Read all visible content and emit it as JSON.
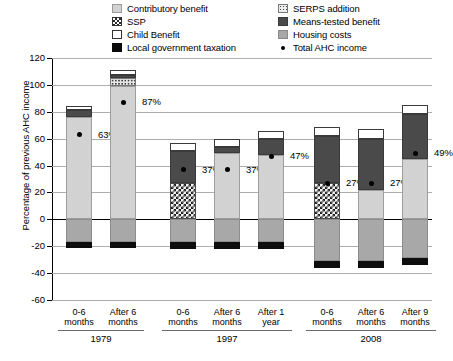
{
  "legend": {
    "left": [
      {
        "label": "Contributory benefit",
        "swatch": "contributory-swatch"
      },
      {
        "label": "SSP",
        "swatch": "ssp-swatch"
      },
      {
        "label": "Child Benefit",
        "swatch": "child-benefit-swatch"
      },
      {
        "label": "Local government taxation",
        "swatch": "local-government-taxation-swatch"
      }
    ],
    "right": [
      {
        "label": "SERPS addition",
        "swatch": "serps-swatch"
      },
      {
        "label": "Means-tested benefit",
        "swatch": "means-tested-swatch"
      },
      {
        "label": "Housing costs",
        "swatch": "housing-costs-swatch"
      },
      {
        "label": "Total AHC income",
        "swatch": "total-ahc-income-marker"
      }
    ]
  },
  "chart_data": {
    "type": "bar",
    "title": "",
    "xlabel": "",
    "ylabel": "Percentage of previous AHC income",
    "ylim": [
      -60,
      120
    ],
    "yticks": [
      120,
      100,
      80,
      60,
      40,
      20,
      0,
      -20,
      -40,
      -60
    ],
    "grid": true,
    "legend_position": "top",
    "stacked": true,
    "groups": [
      {
        "year": "1979",
        "categories": [
          "0-6 months",
          "After 6 months"
        ]
      },
      {
        "year": "1997",
        "categories": [
          "0-6 months",
          "After 6 months",
          "After 1 year"
        ]
      },
      {
        "year": "2008",
        "categories": [
          "0-6 months",
          "After 6 months",
          "After 9 months"
        ]
      }
    ],
    "categories": [
      "0-6 months",
      "After 6 months",
      "0-6 months",
      "After 6 months",
      "After 1 year",
      "0-6 months",
      "After 6 months",
      "After 9 months"
    ],
    "series": [
      {
        "name": "Contributory benefit",
        "values": [
          76,
          99,
          0,
          49,
          48,
          0,
          22,
          45
        ]
      },
      {
        "name": "SSP",
        "values": [
          0,
          0,
          27,
          0,
          0,
          27,
          0,
          0
        ]
      },
      {
        "name": "SERPS addition",
        "values": [
          0,
          6,
          0,
          0,
          0,
          0,
          0,
          0
        ]
      },
      {
        "name": "Means-tested benefit",
        "values": [
          5,
          2,
          24,
          5,
          12,
          35,
          38,
          33
        ]
      },
      {
        "name": "Child Benefit",
        "values": [
          3,
          4,
          6,
          6,
          6,
          7,
          7,
          7
        ]
      },
      {
        "name": "Housing costs",
        "values": [
          -17,
          -17,
          -17,
          -17,
          -17,
          -31,
          -31,
          -29
        ]
      },
      {
        "name": "Local government taxation",
        "values": [
          -4,
          -4,
          -5,
          -5,
          -5,
          -5,
          -5,
          -5
        ]
      }
    ],
    "total_ahc_income": {
      "name": "Total AHC income",
      "values": [
        63,
        87,
        37,
        37,
        47,
        27,
        27,
        49
      ],
      "labels": [
        "63%",
        "87%",
        "37%",
        "37%",
        "47%",
        "27%",
        "27%",
        "49%"
      ]
    }
  }
}
